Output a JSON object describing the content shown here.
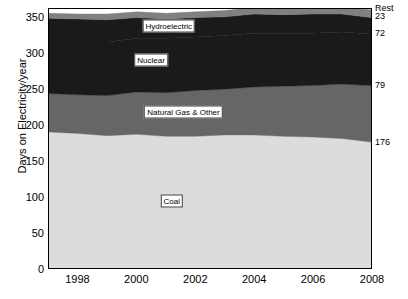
{
  "chart_data": {
    "type": "area",
    "title": "",
    "xlabel": "",
    "ylabel": "Days on Electricity/year",
    "xlim": [
      1997,
      2008
    ],
    "ylim": [
      0,
      362
    ],
    "yticks": [
      0,
      50,
      100,
      150,
      200,
      250,
      300,
      350
    ],
    "xticks": [
      1998,
      2000,
      2002,
      2004,
      2006,
      2008
    ],
    "grid": false,
    "legend": "in-plot labels",
    "stacked": true,
    "x": [
      1997,
      1998,
      1999,
      2000,
      2001,
      2002,
      2003,
      2004,
      2005,
      2006,
      2007,
      2008
    ],
    "series": [
      {
        "name": "Coal",
        "color": "#dcdcdc",
        "end_value": 176,
        "values": [
          190,
          188,
          185,
          187,
          184,
          184,
          186,
          186,
          184,
          183,
          181,
          176
        ]
      },
      {
        "name": "Natural Gas & Other",
        "color": "#666666",
        "end_value": 79,
        "values": [
          54,
          54,
          56,
          59,
          61,
          64,
          64,
          67,
          70,
          72,
          76,
          79
        ]
      },
      {
        "name": "Nuclear",
        "color": "#1a1a1a",
        "end_value": 72,
        "values": [
          72,
          74,
          75,
          75,
          76,
          75,
          75,
          75,
          74,
          73,
          73,
          72
        ]
      },
      {
        "name": "Hydroelectric",
        "color": "#1a1a1a",
        "end_value": 23,
        "values": [
          33,
          32,
          31,
          29,
          27,
          27,
          26,
          27,
          26,
          27,
          25,
          23
        ]
      },
      {
        "name": "Rest",
        "color": "#808080",
        "end_value": null,
        "values": [
          7,
          7,
          8,
          8,
          8,
          8,
          9,
          9,
          9,
          10,
          10,
          11
        ]
      }
    ],
    "right_labels": [
      {
        "text": "Rest",
        "value": 362
      },
      {
        "text": "23",
        "value": 351
      },
      {
        "text": "72",
        "value": 327
      },
      {
        "text": "79",
        "value": 255
      },
      {
        "text": "176",
        "value": 176
      }
    ],
    "inplot_labels": [
      {
        "text": "Hydroelectric",
        "x": 2001.1,
        "y": 337
      },
      {
        "text": "Nuclear",
        "x": 2000.5,
        "y": 290
      },
      {
        "text": "Natural Gas & Other",
        "x": 2001.6,
        "y": 218
      },
      {
        "text": "Coal",
        "x": 2001.2,
        "y": 95
      }
    ]
  }
}
